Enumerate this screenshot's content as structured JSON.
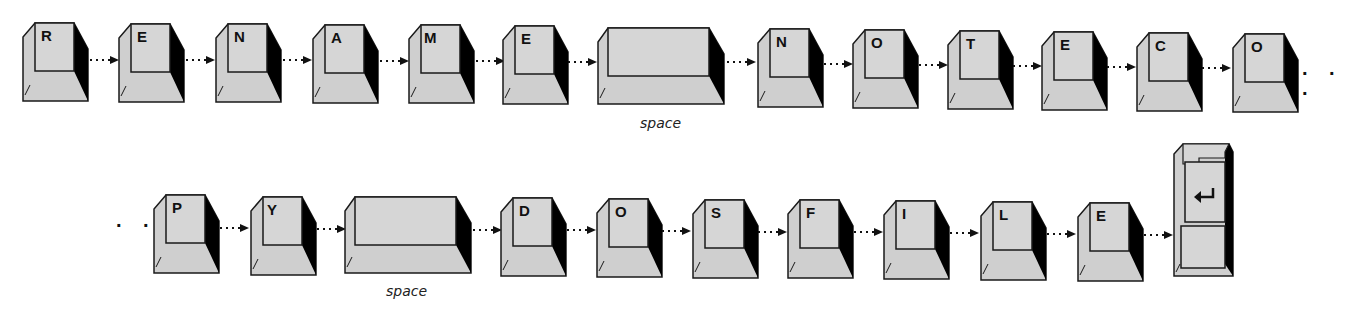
{
  "diagram": {
    "colors": {
      "key_face": "#d4d4d4",
      "key_side": "#c8c8c8",
      "key_shadow": "#000000",
      "outline": "#1a1a1a",
      "arrow": "#111111"
    },
    "rows": [
      {
        "keys": [
          {
            "label": "R",
            "type": "char"
          },
          {
            "label": "E",
            "type": "char"
          },
          {
            "label": "N",
            "type": "char"
          },
          {
            "label": "A",
            "type": "char"
          },
          {
            "label": "M",
            "type": "char"
          },
          {
            "label": "E",
            "type": "char"
          },
          {
            "label": "",
            "type": "space",
            "caption": "space"
          },
          {
            "label": "N",
            "type": "char"
          },
          {
            "label": "O",
            "type": "char"
          },
          {
            "label": "T",
            "type": "char"
          },
          {
            "label": "E",
            "type": "char"
          },
          {
            "label": "C",
            "type": "char"
          },
          {
            "label": "O",
            "type": "char"
          }
        ],
        "trailing_ellipsis": ". . ."
      },
      {
        "leading_ellipsis": ". . .",
        "keys": [
          {
            "label": "P",
            "type": "char"
          },
          {
            "label": "Y",
            "type": "char"
          },
          {
            "label": "",
            "type": "space",
            "caption": "space"
          },
          {
            "label": "D",
            "type": "char"
          },
          {
            "label": "O",
            "type": "char"
          },
          {
            "label": "S",
            "type": "char"
          },
          {
            "label": "F",
            "type": "char"
          },
          {
            "label": "I",
            "type": "char"
          },
          {
            "label": "L",
            "type": "char"
          },
          {
            "label": "E",
            "type": "char"
          },
          {
            "label": "",
            "type": "enter",
            "icon": "enter-arrow-icon"
          }
        ]
      }
    ]
  }
}
